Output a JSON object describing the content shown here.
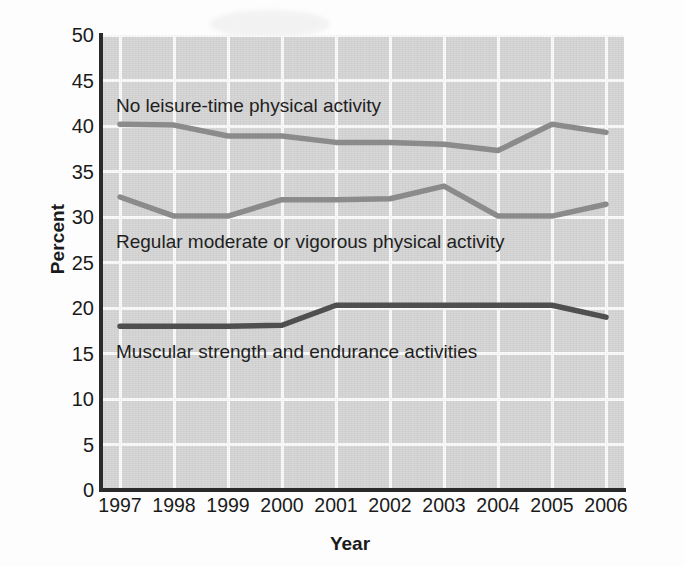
{
  "chart_data": {
    "type": "line",
    "title": "",
    "xlabel": "Year",
    "ylabel": "Percent",
    "categories": [
      "1997",
      "1998",
      "1999",
      "2000",
      "2001",
      "2002",
      "2003",
      "2004",
      "2005",
      "2006"
    ],
    "xlim": [
      1997,
      2006
    ],
    "ylim": [
      0,
      50
    ],
    "yticks": [
      "0",
      "5",
      "10",
      "15",
      "20",
      "25",
      "30",
      "35",
      "40",
      "45",
      "50"
    ],
    "ytick_values": [
      0,
      5,
      10,
      15,
      20,
      25,
      30,
      35,
      40,
      45,
      50
    ],
    "grid": true,
    "legend_position": "inline-annotations",
    "series": [
      {
        "name": "No leisure-time physical activity",
        "color": "#8b8b8b",
        "values": [
          40.2,
          40.1,
          38.9,
          38.9,
          38.2,
          38.2,
          38.0,
          37.3,
          40.2,
          39.3
        ]
      },
      {
        "name": "Regular moderate or vigorous physical activity",
        "color": "#8b8b8b",
        "values": [
          32.2,
          30.1,
          30.1,
          31.9,
          31.9,
          32.0,
          33.4,
          30.1,
          30.1,
          31.4
        ]
      },
      {
        "name": "Muscular strength and endurance activities",
        "color": "#4f4f4f",
        "values": [
          18.0,
          18.0,
          18.0,
          18.1,
          20.3,
          20.3,
          20.3,
          20.3,
          20.3,
          19.0
        ]
      }
    ],
    "annotations": [
      {
        "text": "No leisure-time physical activity",
        "series": 0
      },
      {
        "text": "Regular moderate or vigorous physical activity",
        "series": 1
      },
      {
        "text": "Muscular strength and endurance activities",
        "series": 2
      }
    ],
    "colors": {
      "plot_background": "#d6d6d6",
      "gridline": "#fbfbfb",
      "axis": "#2a2a2a",
      "text": "#1b1b1b",
      "series_light": "#8b8b8b",
      "series_dark": "#4f4f4f"
    }
  }
}
